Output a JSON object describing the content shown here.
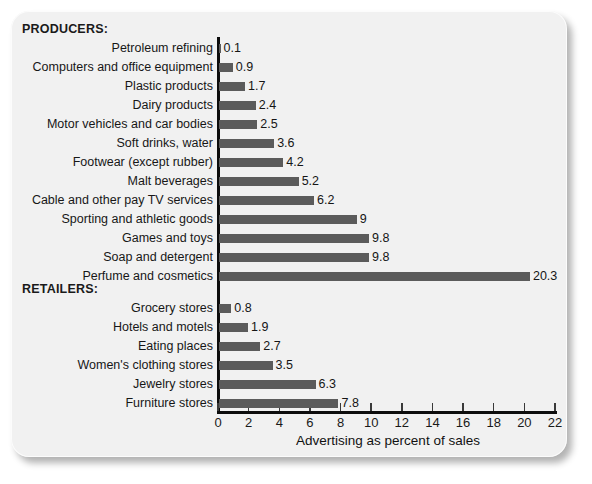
{
  "chart_data": {
    "type": "bar",
    "orientation": "horizontal",
    "title": "",
    "xlabel": "Advertising as percent of sales",
    "ylabel": "",
    "xlim": [
      0,
      22
    ],
    "xticks": [
      0,
      2,
      4,
      6,
      8,
      10,
      12,
      14,
      16,
      18,
      20,
      22
    ],
    "grid": false,
    "legend": false,
    "bar_color": "#5b5b5b",
    "axis_color": "#0d0d0d",
    "background_color": "#f1f1f1",
    "groups": [
      {
        "heading": "PRODUCERS:",
        "categories": [
          "Petroleum refining",
          "Computers and office equipment",
          "Plastic products",
          "Dairy products",
          "Motor vehicles and car bodies",
          "Soft drinks, water",
          "Footwear (except rubber)",
          "Malt beverages",
          "Cable and other pay TV services",
          "Sporting and athletic goods",
          "Games and toys",
          "Soap and detergent",
          "Perfume and cosmetics"
        ],
        "values": [
          0.1,
          0.9,
          1.7,
          2.4,
          2.5,
          3.6,
          4.2,
          5.2,
          6.2,
          9,
          9.8,
          9.8,
          20.3
        ],
        "value_labels": [
          "0.1",
          "0.9",
          "1.7",
          "2.4",
          "2.5",
          "3.6",
          "4.2",
          "5.2",
          "6.2",
          "9",
          "9.8",
          "9.8",
          "20.3"
        ]
      },
      {
        "heading": "RETAILERS:",
        "categories": [
          "Grocery stores",
          "Hotels and motels",
          "Eating places",
          "Women's clothing stores",
          "Jewelry stores",
          "Furniture stores"
        ],
        "values": [
          0.8,
          1.9,
          2.7,
          3.5,
          6.3,
          7.8
        ],
        "value_labels": [
          "0.8",
          "1.9",
          "2.7",
          "3.5",
          "6.3",
          "7.8"
        ]
      }
    ]
  }
}
